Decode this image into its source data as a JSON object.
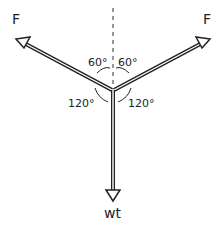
{
  "diagram": {
    "type": "free-body force diagram",
    "forces": [
      {
        "id": "left",
        "label": "F",
        "direction": "up-left"
      },
      {
        "id": "right",
        "label": "F",
        "direction": "up-right"
      },
      {
        "id": "down",
        "label": "wt",
        "direction": "down"
      }
    ],
    "angles": [
      {
        "label": "60°",
        "between": "left force and vertical"
      },
      {
        "label": "60°",
        "between": "right force and vertical"
      },
      {
        "label": "120°",
        "between": "left force and weight"
      },
      {
        "label": "120°",
        "between": "right force and weight"
      }
    ],
    "reference_line": "vertical dashed line",
    "colors": {
      "ink": "#222222",
      "background": "#ffffff"
    }
  }
}
